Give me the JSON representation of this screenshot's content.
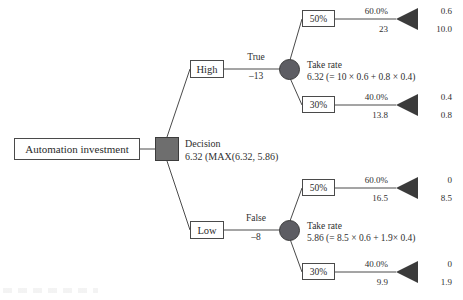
{
  "diagram": {
    "type": "decision-tree",
    "root": {
      "label": "Automation investment"
    },
    "decision_node": {
      "title": "Decision",
      "value": "6.32 (MAX(6.32, 5.86)"
    },
    "branches": [
      {
        "id": "high",
        "box_label": "High",
        "edge_label_top": "True",
        "edge_label_bottom": "–13",
        "chance_title": "Take rate",
        "chance_formula": "6.32 (= 10 × 0.6 + 0.8 × 0.4)",
        "outcomes": [
          {
            "pct_box": "50%",
            "prob": "60.0%",
            "payoff": "23",
            "end_top": "0.6",
            "end_bottom": "10.0"
          },
          {
            "pct_box": "30%",
            "prob": "40.0%",
            "payoff": "13.8",
            "end_top": "0.4",
            "end_bottom": "0.8"
          }
        ]
      },
      {
        "id": "low",
        "box_label": "Low",
        "edge_label_top": "False",
        "edge_label_bottom": "–8",
        "chance_title": "Take rate",
        "chance_formula": "5.86 (= 8.5 × 0.6 + 1.9× 0.4)",
        "outcomes": [
          {
            "pct_box": "50%",
            "prob": "60.0%",
            "payoff": "16.5",
            "end_top": "0",
            "end_bottom": "8.5"
          },
          {
            "pct_box": "30%",
            "prob": "40.0%",
            "payoff": "9.9",
            "end_top": "0",
            "end_bottom": "1.9"
          }
        ]
      }
    ],
    "colors": {
      "decision_node_fill": "#6e6e6e",
      "chance_node_fill": "#5d5d63",
      "terminal_fill": "#3b3b3b",
      "line": "#4a4a4a",
      "text": "#2f2f2f",
      "background": "#ffffff"
    }
  }
}
